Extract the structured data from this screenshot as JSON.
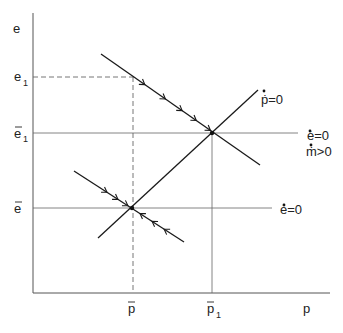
{
  "diagram": {
    "type": "phase-diagram",
    "axes": {
      "y_label": "e",
      "x_label": "p"
    },
    "y_ticks": [
      {
        "base": "e",
        "bar": false,
        "sub": "1",
        "id": "e1"
      },
      {
        "base": "e",
        "bar": true,
        "sub": "1",
        "id": "ebar1"
      },
      {
        "base": "e",
        "bar": true,
        "sub": "",
        "id": "ebar"
      }
    ],
    "x_ticks": [
      {
        "base": "p",
        "bar": true,
        "sub": "",
        "id": "pbar"
      },
      {
        "base": "p",
        "bar": true,
        "sub": "1",
        "id": "pbar1"
      }
    ],
    "curve_labels": {
      "pdot_zero": "ṗ=0",
      "edot_zero_new": "ė=0",
      "mdot_positive": "ṁ>0",
      "edot_zero_old": "ė=0"
    },
    "equilibria": [
      {
        "name": "initial",
        "p": "p̄",
        "e": "ē"
      },
      {
        "name": "new",
        "p": "p̄1",
        "e": "ē1"
      }
    ],
    "saddle_paths": [
      {
        "name": "initial-saddle",
        "arrows_toward_equilibrium_from_left": 3,
        "arrows_toward_equilibrium_from_right": 3
      },
      {
        "name": "new-saddle",
        "arrows_toward_equilibrium_from_left": 5
      }
    ],
    "annotations": {
      "jump": "Exchange rate jumps from ē to e1 at p̄, then converges along new saddle path to (p̄1, ē1)"
    }
  }
}
